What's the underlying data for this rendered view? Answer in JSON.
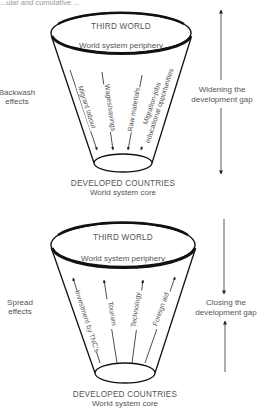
{
  "caption_fragment": "...ular and cumulative ...",
  "upper_diagram": {
    "top_label": "THIRD WORLD",
    "top_sublabel": "World system periphery",
    "bottom_label": "DEVELOPED COUNTRIES",
    "bottom_sublabel": "World system core",
    "side_label_line1": "Backwash",
    "side_label_line2": "effects",
    "flows": [
      "Migrant labour",
      "Wages/savings",
      "Raw materials",
      "Migration-jobs",
      "educational opportunities"
    ],
    "flow_direction": "down",
    "gap_label_line1": "Widening the",
    "gap_label_line2": "development gap"
  },
  "lower_diagram": {
    "top_label": "THIRD WORLD",
    "top_sublabel": "World system periphery",
    "bottom_label": "DEVELOPED COUNTRIES",
    "bottom_sublabel": "World system core",
    "side_label_line1": "Spread",
    "side_label_line2": "effects",
    "flows": [
      "Investment by TNC's",
      "Tourism",
      "Technology",
      "Foreign aid"
    ],
    "flow_direction": "up",
    "gap_label_line1": "Closing the",
    "gap_label_line2": "development gap"
  },
  "colors": {
    "line": "#111111",
    "text": "#555555",
    "arrow": "#333333"
  }
}
